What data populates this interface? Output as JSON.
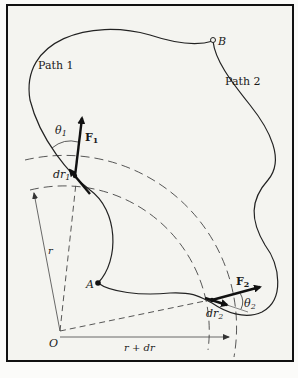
{
  "figure": {
    "frame_color": "#111111",
    "background": "#f4f4f0",
    "ink_color": "#1a1a1a"
  },
  "labels": {
    "path1": "Path 1",
    "path2": "Path 2",
    "point_a": "A",
    "point_b": "B",
    "origin": "O",
    "radius": "r",
    "radius_plus": "r + dr",
    "theta1": "θ",
    "theta1_sub": "1",
    "theta2": "θ",
    "theta2_sub": "2",
    "force1": "F",
    "force1_sub": "1",
    "force2": "F",
    "force2_sub": "2",
    "dr1": "dr",
    "dr1_sub": "1",
    "dr2": "dr",
    "dr2_sub": "2"
  }
}
